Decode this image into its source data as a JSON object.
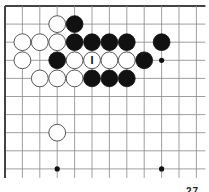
{
  "board": {
    "cols": 12,
    "rows": 10,
    "x0": 5,
    "y0": 6,
    "dx": 17.4,
    "dy": 18.1,
    "right_edge_open": true,
    "bottom_edge_open": true,
    "line_color": "#888888",
    "border_color": "#444444"
  },
  "star_points": [
    [
      9,
      3
    ],
    [
      3,
      9
    ],
    [
      9,
      9
    ]
  ],
  "stones": [
    {
      "color": "white",
      "col": 3,
      "row": 1
    },
    {
      "color": "black",
      "col": 4,
      "row": 1
    },
    {
      "color": "white",
      "col": 1,
      "row": 2
    },
    {
      "color": "white",
      "col": 2,
      "row": 2
    },
    {
      "color": "white",
      "col": 3,
      "row": 2
    },
    {
      "color": "black",
      "col": 4,
      "row": 2
    },
    {
      "color": "black",
      "col": 5,
      "row": 2
    },
    {
      "color": "black",
      "col": 6,
      "row": 2
    },
    {
      "color": "black",
      "col": 7,
      "row": 2
    },
    {
      "color": "black",
      "col": 9,
      "row": 2
    },
    {
      "color": "white",
      "col": 1,
      "row": 3
    },
    {
      "color": "black",
      "col": 3,
      "row": 3
    },
    {
      "color": "white",
      "col": 4,
      "row": 3
    },
    {
      "color": "white",
      "col": 5,
      "row": 3,
      "label": "I"
    },
    {
      "color": "white",
      "col": 6,
      "row": 3
    },
    {
      "color": "white",
      "col": 7,
      "row": 3
    },
    {
      "color": "black",
      "col": 8,
      "row": 3
    },
    {
      "color": "white",
      "col": 2,
      "row": 4
    },
    {
      "color": "white",
      "col": 3,
      "row": 4
    },
    {
      "color": "white",
      "col": 4,
      "row": 4
    },
    {
      "color": "black",
      "col": 5,
      "row": 4
    },
    {
      "color": "black",
      "col": 6,
      "row": 4
    },
    {
      "color": "black",
      "col": 7,
      "row": 4
    },
    {
      "color": "white",
      "col": 3,
      "row": 7
    }
  ],
  "caption": "27"
}
